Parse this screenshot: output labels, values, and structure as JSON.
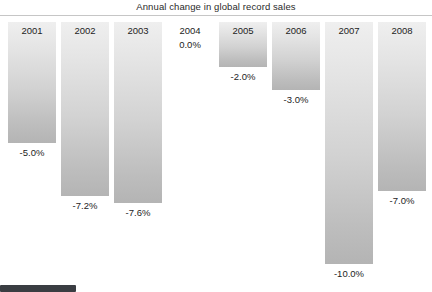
{
  "chart_data": {
    "type": "bar",
    "title": "Annual change in global record sales",
    "xlabel": "",
    "ylabel": "",
    "grid": false,
    "legend": "none",
    "orientation": "vertical-down",
    "categories": [
      "2001",
      "2002",
      "2003",
      "2004",
      "2005",
      "2006",
      "2007",
      "2008"
    ],
    "values": [
      -5.0,
      -7.2,
      -7.6,
      0.0,
      -2.0,
      -3.0,
      -10.0,
      -7.0
    ],
    "value_labels": [
      "-5.0%",
      "-7.2%",
      "-7.6%",
      "0.0%",
      "-2.0%",
      "-3.0%",
      "-10.0%",
      "-7.0%"
    ],
    "ylim": [
      -10.0,
      0.0
    ],
    "units": "percent"
  },
  "chart": {
    "title": "Annual change in global record sales",
    "bars": [
      {
        "year": "2001",
        "value_label": "-5.0%",
        "x": 8,
        "height": 121,
        "zero": false
      },
      {
        "year": "2002",
        "value_label": "-7.2%",
        "x": 61,
        "height": 174,
        "zero": false
      },
      {
        "year": "2003",
        "value_label": "-7.6%",
        "x": 114,
        "height": 181,
        "zero": false
      },
      {
        "year": "2004",
        "value_label": "0.0%",
        "x": 166,
        "height": 0,
        "zero": true
      },
      {
        "year": "2005",
        "value_label": "-2.0%",
        "x": 219,
        "height": 45,
        "zero": false
      },
      {
        "year": "2006",
        "value_label": "-3.0%",
        "x": 272,
        "height": 68,
        "zero": false
      },
      {
        "year": "2007",
        "value_label": "-10.0%",
        "x": 325,
        "height": 242,
        "zero": false
      },
      {
        "year": "2008",
        "value_label": "-7.0%",
        "x": 378,
        "height": 169,
        "zero": false
      }
    ]
  },
  "scrollbar": {
    "orientation": "horizontal",
    "thumb_color": "#3a3d42"
  }
}
